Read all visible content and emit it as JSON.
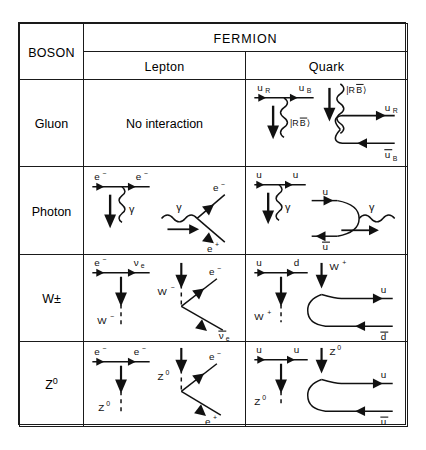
{
  "table": {
    "corner_header": "BOSON",
    "fermion_header": "FERMION",
    "sub_headers": [
      "Lepton",
      "Quark"
    ],
    "rows": [
      {
        "boson": "Gluon",
        "boson_name": "gluon",
        "lepton": {
          "text": "No interaction",
          "has_diagram": false
        },
        "quark": {
          "has_diagram": true,
          "diagrams": [
            {
              "type": "emission-vertex",
              "incoming": "u_R",
              "outgoing": "u_B",
              "boson_emitted": "|RB̄⟩",
              "labels": [
                "u",
                "R",
                "u",
                "B",
                "|RB̄⟩"
              ]
            },
            {
              "type": "pair-creation",
              "incoming_boson": "|RB̄⟩",
              "products": [
                "u_R",
                "ū_B"
              ],
              "labels": [
                "|RB̄⟩",
                "u",
                "R",
                "u",
                "B"
              ]
            }
          ]
        }
      },
      {
        "boson": "Photon",
        "boson_name": "photon",
        "lepton": {
          "has_diagram": true,
          "diagrams": [
            {
              "type": "emission-vertex",
              "incoming": "e−",
              "outgoing": "e−",
              "boson_emitted": "γ"
            },
            {
              "type": "pair-creation",
              "incoming_boson": "γ",
              "products": [
                "e−",
                "e+"
              ]
            }
          ]
        },
        "quark": {
          "has_diagram": true,
          "diagrams": [
            {
              "type": "emission-vertex",
              "incoming": "u",
              "outgoing": "u",
              "boson_emitted": "γ"
            },
            {
              "type": "annihilation",
              "incoming": [
                "u",
                "ū"
              ],
              "boson_emitted": "γ"
            }
          ]
        }
      },
      {
        "boson": "W±",
        "boson_name": "w-boson",
        "lepton": {
          "has_diagram": true,
          "diagrams": [
            {
              "type": "emission-vertex",
              "incoming": "e−",
              "outgoing": "νe",
              "boson_emitted": "W−"
            },
            {
              "type": "decay",
              "incoming_boson": "W−",
              "products": [
                "e−",
                "ν̄e"
              ]
            }
          ]
        },
        "quark": {
          "has_diagram": true,
          "diagrams": [
            {
              "type": "emission-vertex",
              "incoming": "u",
              "outgoing": "d",
              "boson_emitted": "W+"
            },
            {
              "type": "decay",
              "incoming_boson": "W+",
              "products": [
                "u",
                "d̄"
              ]
            }
          ]
        }
      },
      {
        "boson": "Z0",
        "boson_name": "z-boson",
        "lepton": {
          "has_diagram": true,
          "diagrams": [
            {
              "type": "emission-vertex",
              "incoming": "e−",
              "outgoing": "e−",
              "boson_emitted": "Z0"
            },
            {
              "type": "decay",
              "incoming_boson": "Z0",
              "products": [
                "e−",
                "e+"
              ]
            }
          ]
        },
        "quark": {
          "has_diagram": true,
          "diagrams": [
            {
              "type": "emission-vertex",
              "incoming": "u",
              "outgoing": "u",
              "boson_emitted": "Z0"
            },
            {
              "type": "decay",
              "incoming_boson": "Z0",
              "products": [
                "u",
                "ū"
              ]
            }
          ]
        }
      }
    ]
  },
  "labels": {
    "u": "u",
    "d": "d",
    "e_minus": "e",
    "e_plus": "e",
    "nu": "ν",
    "nu_bar": "ν̅",
    "gamma": "γ",
    "u_bar": "u̅",
    "d_bar": "d̅",
    "sub_R": "R",
    "sub_B": "B",
    "sub_e": "e",
    "minus": "−",
    "plus": "+",
    "zero": "0",
    "ket_RBbar": "|RB̅⟩",
    "W": "W",
    "Z": "Z",
    "no_interaction": "No interaction"
  },
  "colors": {
    "line": "#111111",
    "border": "#1a1a1a",
    "background": "#ffffff"
  }
}
